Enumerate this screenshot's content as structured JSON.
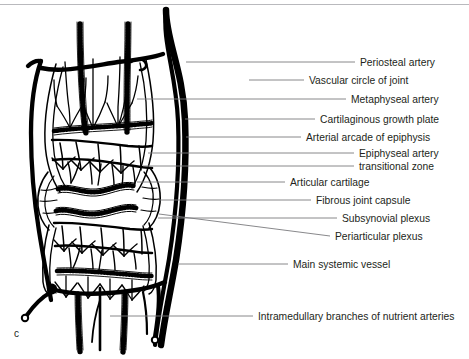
{
  "figure": {
    "letter": "c",
    "caption_rule_color": "#b9b9bd",
    "ink_color": "#000000",
    "leader_color": "#7a7a7e",
    "text_color": "#231f20",
    "background": "#ffffff",
    "width": 469,
    "height": 359
  },
  "labels": [
    {
      "id": "periosteal-artery",
      "text": "Periosteal artery",
      "text_x": 360,
      "text_y": 58,
      "leader_x1": 186,
      "leader_y1": 62,
      "leader_x2": 355,
      "leader_y2": 62
    },
    {
      "id": "vascular-circle-of-joint",
      "text": "Vascular circle of joint",
      "text_x": 309,
      "text_y": 76,
      "leader_x1": 249,
      "leader_y1": 80,
      "leader_x2": 304,
      "leader_y2": 80
    },
    {
      "id": "metaphyseal-artery",
      "text": "Metaphyseal artery",
      "text_x": 351,
      "text_y": 95,
      "leader_x1": 137,
      "leader_y1": 99,
      "leader_x2": 346,
      "leader_y2": 99
    },
    {
      "id": "cartilaginous-growth-plate",
      "text": "Cartilaginous growth plate",
      "text_x": 320,
      "text_y": 115,
      "leader_x1": 185,
      "leader_y1": 119,
      "leader_x2": 315,
      "leader_y2": 119
    },
    {
      "id": "arterial-arcade-of-epiphysis",
      "text": "Arterial arcade of epiphysis",
      "text_x": 306,
      "text_y": 133,
      "leader_x1": 186,
      "leader_y1": 137,
      "leader_x2": 301,
      "leader_y2": 137
    },
    {
      "id": "epiphyseal-artery",
      "text": "Epiphyseal artery",
      "text_x": 359,
      "text_y": 149,
      "leader_x1": 148,
      "leader_y1": 153,
      "leader_x2": 354,
      "leader_y2": 153
    },
    {
      "id": "transitional-zone",
      "text": "transitional zone",
      "text_x": 359,
      "text_y": 162,
      "leader_x1": 143,
      "leader_y1": 166,
      "leader_x2": 354,
      "leader_y2": 166
    },
    {
      "id": "articular-cartilage",
      "text": "Articular cartilage",
      "text_x": 290,
      "text_y": 178,
      "leader_x1": 137,
      "leader_y1": 182,
      "leader_x2": 285,
      "leader_y2": 182
    },
    {
      "id": "fibrous-joint-capsule",
      "text": "Fibrous joint capsule",
      "text_x": 316,
      "text_y": 196,
      "leader_x1": 160,
      "leader_y1": 200,
      "leader_x2": 311,
      "leader_y2": 200
    },
    {
      "id": "subsynovial-plexus",
      "text": "Subsynovial plexus",
      "text_x": 342,
      "text_y": 214,
      "leader_x1": 158,
      "leader_y1": 218,
      "leader_x2": 337,
      "leader_y2": 218
    },
    {
      "id": "periarticular-plexus",
      "text": "Periarticular plexus",
      "text_x": 335,
      "text_y": 232,
      "leader_x1": 159,
      "leader_y1": 214,
      "leader_x2": 330,
      "leader_y2": 236
    },
    {
      "id": "main-systemic-vessel",
      "text": "Main systemic vessel",
      "text_x": 293,
      "text_y": 260,
      "leader_x1": 178,
      "leader_y1": 264,
      "leader_x2": 288,
      "leader_y2": 264
    },
    {
      "id": "intramedullary-branches-of-nutrient-arteries",
      "text": "Intramedullary branches of nutrient arteries",
      "text_x": 258,
      "text_y": 312,
      "leader_x1": 110,
      "leader_y1": 316,
      "leader_x2": 253,
      "leader_y2": 316
    }
  ],
  "diagram": {
    "parts": [
      "main-systemic-vessel-right",
      "periosteal-artery-left",
      "vascular-circle-of-joint",
      "metaphyseal-arteries",
      "cartilaginous-growth-plates",
      "arterial-arcade",
      "epiphyseal-arteries",
      "articular-cartilage",
      "fibrous-joint-capsule",
      "subsynovial-plexus",
      "periarticular-plexus",
      "nutrient-artery-branches"
    ]
  }
}
